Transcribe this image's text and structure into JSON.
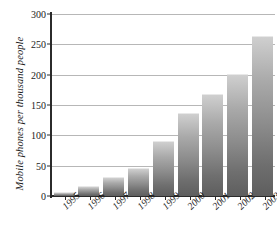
{
  "chart_data": {
    "type": "bar",
    "title": "",
    "xlabel": "",
    "ylabel": "Mobile phones per thousand people",
    "categories": [
      "1995",
      "1996",
      "1997",
      "1998",
      "1999",
      "2000",
      "2001",
      "2002",
      "2003"
    ],
    "values": [
      5,
      15,
      29,
      44,
      89,
      136,
      166,
      200,
      262
    ],
    "ylim": [
      0,
      300
    ],
    "yticks": [
      0,
      50,
      100,
      150,
      200,
      250,
      300
    ],
    "ytick_labels": [
      "0",
      "50",
      "100",
      "150",
      "200",
      "250",
      "300"
    ],
    "grid": true,
    "legend": null,
    "series": [
      {
        "name": "Mobile phones per thousand people",
        "values": [
          5,
          15,
          29,
          44,
          89,
          136,
          166,
          200,
          262
        ]
      }
    ],
    "bar_fill_top_color": "#cfcfcf",
    "bar_fill_bottom_color": "#5e5e5e",
    "gridline_color": "#b7b7b7",
    "axis_color": "#2b2b2b",
    "text_color": "#1b1b1b",
    "background_color": "#ffffff"
  }
}
